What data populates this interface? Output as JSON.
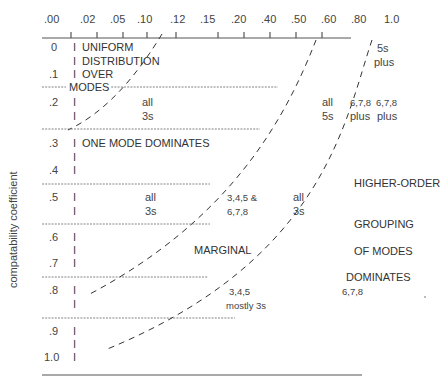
{
  "y_axis_label": "compatability coefficient",
  "top_axis": {
    "ticks": [
      ".00",
      ".02",
      ".05",
      ".10",
      ".12",
      ".15",
      ".20",
      ".40",
      ".50",
      ".60",
      ".80",
      "1.0"
    ]
  },
  "rows": [
    {
      "label": "0"
    },
    {
      "label": ".1"
    },
    {
      "label": ".2"
    },
    {
      "label": ".3"
    },
    {
      "label": ".4"
    },
    {
      "label": ".5"
    },
    {
      "label": ".6"
    },
    {
      "label": ".7"
    },
    {
      "label": ".8"
    },
    {
      "label": ".9"
    },
    {
      "label": "1.0"
    }
  ],
  "region_labels": {
    "uniform": [
      "UNIFORM",
      "DISTRIBUTION",
      "OVER",
      "MODES"
    ],
    "one_mode": "ONE MODE DOMINATES",
    "marginal": "MARGINAL",
    "higher_order": [
      "HIGHER-ORDER",
      "GROUPING",
      "OF MODES",
      "DOMINATES"
    ]
  },
  "cell_labels": {
    "r2_all3s": [
      "all",
      "3s"
    ],
    "r2_all5s": [
      "all",
      "5s"
    ],
    "r2_678plus_a": [
      "6,7,8",
      "plus"
    ],
    "r2_678plus_b": [
      "6,7,8",
      "plus"
    ],
    "r0_5splus": [
      "5s",
      "plus"
    ],
    "r5_all3s_left": [
      "all",
      "3s"
    ],
    "r5_345_678": [
      "3,4,5 &",
      "6,7,8"
    ],
    "r5_all3s_right": [
      "all",
      "3s"
    ],
    "r8_345_mostly": [
      "3,4,5",
      "mostly 3s"
    ],
    "r8_678": "6,7,8"
  },
  "bar_glyph": "I"
}
